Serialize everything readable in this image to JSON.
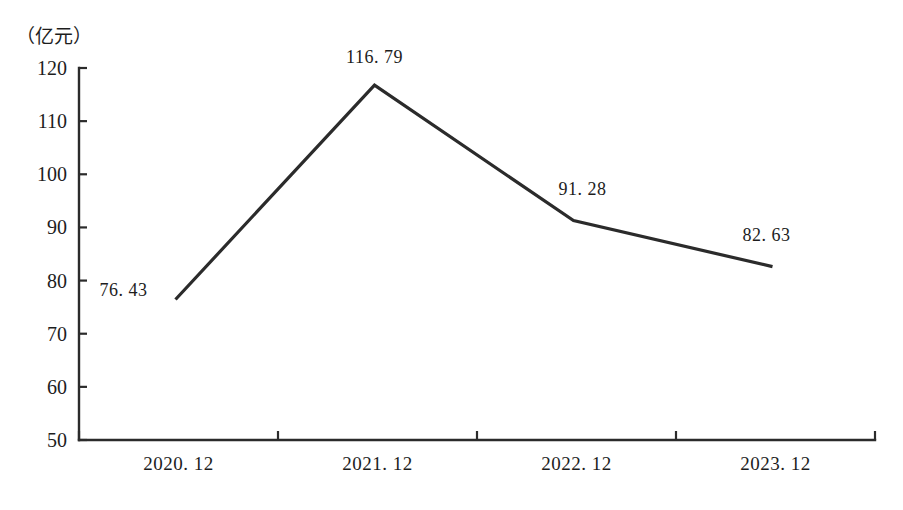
{
  "chart_data": {
    "type": "line",
    "title": "",
    "subtitle": "",
    "xlabel": "",
    "ylabel": "（亿元）",
    "unit_label": "（亿元）",
    "categories": [
      "2020. 12",
      "2021. 12",
      "2022. 12",
      "2023. 12"
    ],
    "values": [
      76.43,
      116.79,
      91.28,
      82.63
    ],
    "point_labels": [
      "76. 43",
      "116. 79",
      "91. 28",
      "82. 63"
    ],
    "series": [
      {
        "name": "",
        "values": [
          76.43,
          116.79,
          91.28,
          82.63
        ],
        "color": "#2b2b2b"
      }
    ],
    "ylim": [
      50,
      120
    ],
    "yticks": [
      50,
      60,
      70,
      80,
      90,
      100,
      110,
      120
    ],
    "ytick_labels": [
      "50",
      "60",
      "70",
      "80",
      "90",
      "100",
      "110",
      "120"
    ],
    "grid": false,
    "legend": false,
    "legend_position": "none",
    "line_color": "#2b2b2b",
    "axis_color": "#2b2b2b",
    "background_color": "#ffffff",
    "markers": false
  }
}
